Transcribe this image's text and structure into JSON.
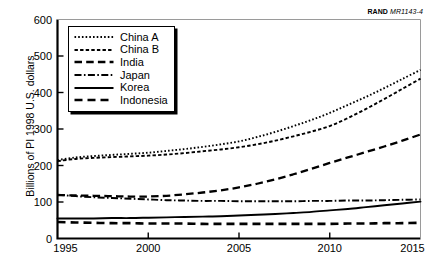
{
  "source_label": {
    "organization": "RAND",
    "code": "MR1143-4"
  },
  "chart_data": {
    "type": "line",
    "title": "",
    "subtitle": "",
    "xlabel": "",
    "ylabel": "Billions of PI 1998 U.S. dollars",
    "xlim": [
      1995,
      2015
    ],
    "ylim": [
      0,
      600
    ],
    "xticks": [
      1995,
      2000,
      2005,
      2010,
      2015
    ],
    "yticks": [
      0,
      100,
      200,
      300,
      400,
      500,
      600
    ],
    "grid": false,
    "legend_position": "upper left inside",
    "x": [
      1995,
      1996,
      1997,
      1998,
      1999,
      2000,
      2001,
      2002,
      2003,
      2004,
      2005,
      2006,
      2007,
      2008,
      2009,
      2010,
      2011,
      2012,
      2013,
      2014,
      2015
    ],
    "series": [
      {
        "name": "China A",
        "style": "dotted",
        "color": "#000000",
        "values": [
          215,
          222,
          226,
          229,
          232,
          235,
          240,
          245,
          251,
          258,
          266,
          278,
          292,
          308,
          325,
          344,
          366,
          388,
          412,
          437,
          462
        ]
      },
      {
        "name": "China B",
        "style": "short-dashed",
        "color": "#000000",
        "values": [
          212,
          218,
          221,
          223,
          225,
          227,
          230,
          234,
          239,
          244,
          250,
          258,
          268,
          280,
          293,
          308,
          330,
          355,
          382,
          410,
          438
        ]
      },
      {
        "name": "India",
        "style": "long-dashed",
        "color": "#000000",
        "values": [
          119,
          118,
          117,
          116,
          115,
          115,
          117,
          121,
          126,
          132,
          140,
          150,
          162,
          176,
          191,
          207,
          222,
          237,
          252,
          268,
          285
        ]
      },
      {
        "name": "Japan",
        "style": "dash-dot",
        "color": "#000000",
        "values": [
          120,
          116,
          113,
          111,
          109,
          107,
          105,
          104,
          103,
          103,
          102,
          102,
          102,
          102,
          103,
          103,
          104,
          104,
          105,
          106,
          107
        ]
      },
      {
        "name": "Korea",
        "style": "solid",
        "color": "#000000",
        "values": [
          55,
          55,
          55,
          56,
          56,
          57,
          58,
          59,
          60,
          61,
          63,
          65,
          67,
          70,
          73,
          77,
          81,
          86,
          91,
          96,
          101
        ]
      },
      {
        "name": "Indonesia",
        "style": "long-dashed-thick",
        "color": "#000000",
        "values": [
          45,
          44,
          43,
          42,
          42,
          41,
          41,
          41,
          40,
          40,
          40,
          40,
          40,
          40,
          40,
          40,
          41,
          41,
          42,
          42,
          43
        ]
      }
    ]
  },
  "legend": {
    "items": [
      {
        "label": "China A"
      },
      {
        "label": "China B"
      },
      {
        "label": "India"
      },
      {
        "label": "Japan"
      },
      {
        "label": "Korea"
      },
      {
        "label": "Indonesia"
      }
    ]
  }
}
